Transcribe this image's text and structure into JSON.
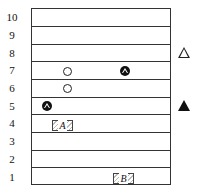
{
  "diagram": {
    "rows": [
      "10",
      "9",
      "8",
      "7",
      "6",
      "5",
      "4",
      "3",
      "2",
      "1"
    ],
    "markers": [
      {
        "type": "open-circle",
        "row": 7
      },
      {
        "type": "open-circle",
        "row": 6
      },
      {
        "type": "circled-triangle",
        "row": 7
      },
      {
        "type": "circled-triangle",
        "row": 5
      }
    ],
    "boxes": [
      {
        "label": "A",
        "row": 4
      },
      {
        "label": "B",
        "row": 1
      }
    ],
    "legend": [
      {
        "symbol": "open-triangle",
        "row": 8
      },
      {
        "symbol": "filled-triangle",
        "row": 5
      }
    ]
  }
}
